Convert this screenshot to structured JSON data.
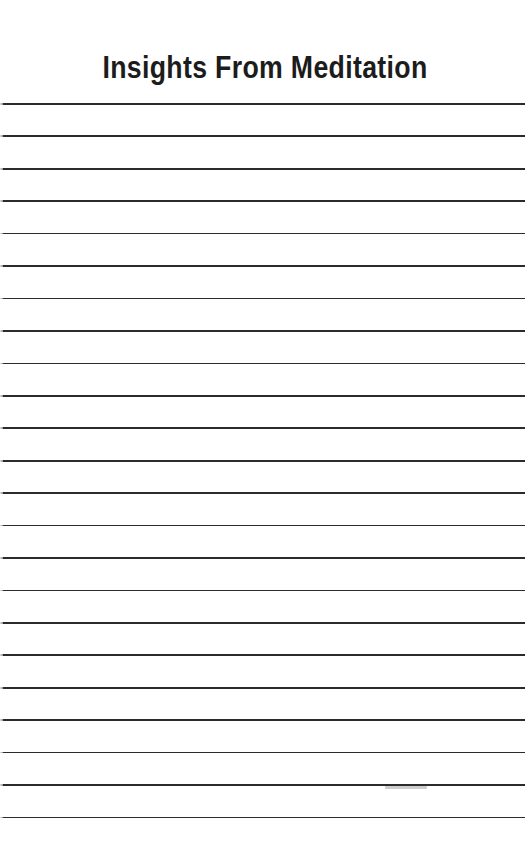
{
  "document": {
    "title": "Insights From Meditation",
    "page_background": "#ffffff",
    "title_color": "#1c1c1c",
    "rule_color": "#2b2b2b",
    "rule_count": 23,
    "rule_spacing_px": 32.45,
    "first_rule_top_px": 103,
    "rule_thickness_px": 1.7,
    "page_width_px": 530,
    "page_height_px": 846,
    "has_header_rule": true,
    "body_text": ""
  }
}
